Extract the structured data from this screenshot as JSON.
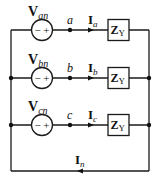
{
  "diagram": {
    "type": "three-phase Y-connected circuit",
    "phases": [
      {
        "source_main": "V",
        "source_sub": "an",
        "node": "a",
        "current_main": "I",
        "current_sub": "a",
        "load_main": "Z",
        "load_sub": "Y",
        "polarity": "− +"
      },
      {
        "source_main": "V",
        "source_sub": "bn",
        "node": "b",
        "current_main": "I",
        "current_sub": "b",
        "load_main": "Z",
        "load_sub": "Y",
        "polarity": "− +"
      },
      {
        "source_main": "V",
        "source_sub": "cn",
        "node": "c",
        "current_main": "I",
        "current_sub": "c",
        "load_main": "Z",
        "load_sub": "Y",
        "polarity": "− +"
      }
    ],
    "neutral": {
      "current_main": "I",
      "current_sub": "n"
    }
  }
}
